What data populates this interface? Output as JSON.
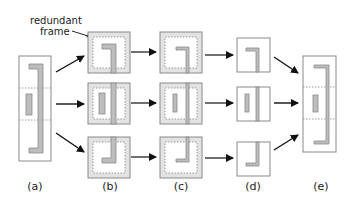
{
  "diagram": {
    "annotation": {
      "line1": "redundant",
      "line2": "frame"
    },
    "columns": [
      {
        "id": "a",
        "label": "(a)"
      },
      {
        "id": "b",
        "label": "(b)"
      },
      {
        "id": "c",
        "label": "(c)"
      },
      {
        "id": "d",
        "label": "(d)"
      },
      {
        "id": "e",
        "label": "(e)"
      }
    ],
    "colors": {
      "frame_stroke": "#8a8a8a",
      "shape_fill": "#bdbdbd",
      "redundant_frame_fill": "#e3e3e3",
      "arrow": "#111111",
      "dashed_divider": "#9a9a9a"
    }
  }
}
